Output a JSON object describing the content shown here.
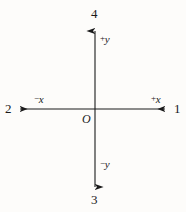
{
  "figure": {
    "type": "cartesian-axes-diagram",
    "background_color": "#fdfcfa",
    "line_color": "#1a1a1a",
    "origin": {
      "label": "O",
      "x": 95,
      "y": 109
    },
    "axes": [
      {
        "name": "y-axis",
        "orientation": "vertical",
        "positive_label": "+y",
        "negative_label": "-y",
        "from": {
          "x": 95,
          "y": 190
        },
        "to": {
          "x": 95,
          "y": 28
        }
      },
      {
        "name": "x-axis",
        "orientation": "horizontal",
        "positive_label": "+x",
        "negative_label": "-x",
        "from": {
          "x": 17,
          "y": 109
        },
        "to": {
          "x": 168,
          "y": 109
        }
      }
    ],
    "labels": {
      "pos_y_sign": "+",
      "pos_y_var": "y",
      "neg_y_sign": "−",
      "neg_y_var": "y",
      "pos_x_sign": "+",
      "pos_x_var": "x",
      "neg_x_sign": "−",
      "neg_x_var": "x",
      "origin": "O"
    },
    "callouts": [
      {
        "id": "callout-right",
        "text": "1",
        "position": "right",
        "points_to": "+x axis arrow"
      },
      {
        "id": "callout-left",
        "text": "2",
        "position": "left",
        "points_to": "-x axis arrow"
      },
      {
        "id": "callout-bottom",
        "text": "3",
        "position": "bottom",
        "points_to": "-y axis arrow"
      },
      {
        "id": "callout-top",
        "text": "4",
        "position": "top",
        "points_to": "+y axis arrow"
      }
    ]
  }
}
